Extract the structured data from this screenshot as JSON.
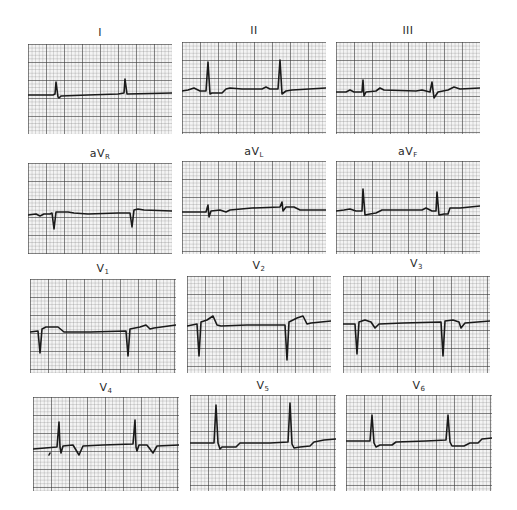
{
  "figure": {
    "layout": {
      "rows": 4,
      "columns": 3
    },
    "colors": {
      "grid_major": "#5a5a5a",
      "grid_minor": "#a8a8a8",
      "paper": "#f4f4f4",
      "trace": "#1a1a1a"
    }
  },
  "leads": [
    {
      "id": "I",
      "label": "I",
      "sub": ""
    },
    {
      "id": "II",
      "label": "II",
      "sub": ""
    },
    {
      "id": "III",
      "label": "III",
      "sub": ""
    },
    {
      "id": "aVR",
      "label": "aV",
      "sub": "R"
    },
    {
      "id": "aVL",
      "label": "aV",
      "sub": "L"
    },
    {
      "id": "aVF",
      "label": "aV",
      "sub": "F"
    },
    {
      "id": "V1",
      "label": "V",
      "sub": "1"
    },
    {
      "id": "V2",
      "label": "V",
      "sub": "2"
    },
    {
      "id": "V3",
      "label": "V",
      "sub": "3"
    },
    {
      "id": "V4",
      "label": "V",
      "sub": "4"
    },
    {
      "id": "V5",
      "label": "V",
      "sub": "5"
    },
    {
      "id": "V6",
      "label": "V",
      "sub": "6"
    }
  ]
}
